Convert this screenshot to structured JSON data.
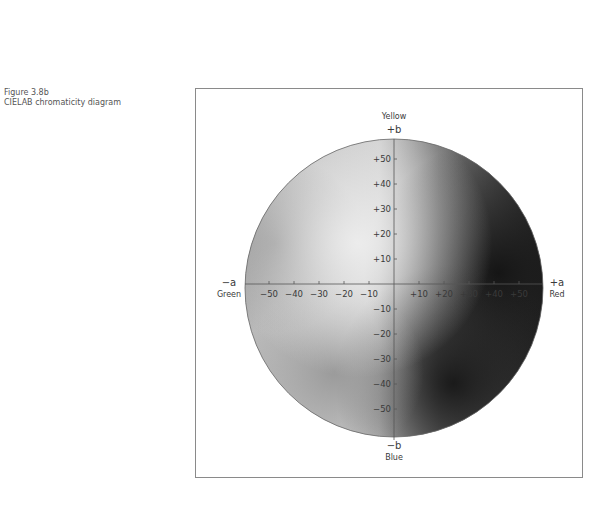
{
  "figure": {
    "number": "Figure 3.8b",
    "title": "CIELAB chromaticity diagram"
  },
  "axes": {
    "b_positive": {
      "sign": "+b",
      "name": "Yellow"
    },
    "b_negative": {
      "sign": "−b",
      "name": "Blue"
    },
    "a_negative": {
      "sign": "−a",
      "name": "Green"
    },
    "a_positive": {
      "sign": "+a",
      "name": "Red"
    },
    "a_ticks_negative": [
      "−50",
      "−40",
      "−30",
      "−20",
      "−10"
    ],
    "a_ticks_positive": [
      "+10",
      "+20",
      "+30",
      "+40",
      "+50"
    ],
    "b_ticks_positive": [
      "+50",
      "+40",
      "+30",
      "+20",
      "+10"
    ],
    "b_ticks_negative": [
      "−10",
      "−20",
      "−30",
      "−40",
      "−50"
    ]
  },
  "colors": {
    "frame": "#8a8a8a",
    "axis": "#555555",
    "light_region": "#e6e6e6",
    "dark_region": "#1e1e1e"
  }
}
